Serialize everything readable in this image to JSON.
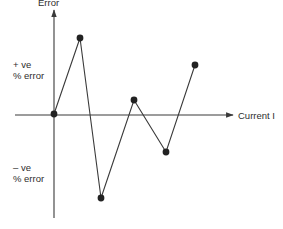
{
  "chart_data": {
    "type": "line",
    "title": "",
    "xlabel": "Current I",
    "ylabel": "Error",
    "annotations": [
      {
        "text": [
          "+ ve",
          "% error"
        ],
        "position": "upper-left, beside y-axis"
      },
      {
        "text": [
          "– ve",
          "% error"
        ],
        "position": "lower-left, beside y-axis"
      }
    ],
    "grid": false,
    "legend": null,
    "axis_ticks": "none (schematic)",
    "points_px": [
      [
        54,
        114
      ],
      [
        80,
        38
      ],
      [
        101,
        198
      ],
      [
        134,
        100
      ],
      [
        166,
        152
      ],
      [
        195,
        65
      ]
    ],
    "series": [
      {
        "name": "error vs current",
        "x": [
          0,
          1,
          2,
          3,
          4,
          5
        ],
        "y": [
          0,
          0.77,
          -0.85,
          0.14,
          -0.38,
          0.5
        ],
        "markers": true
      }
    ],
    "ylim": [
      -1,
      1
    ]
  },
  "labels": {
    "y_title": "Error",
    "x_title": "Current I",
    "positive_line1": "+ ve",
    "positive_line2": "% error",
    "negative_line1": "– ve",
    "negative_line2": "% error"
  },
  "colors": {
    "line": "#3a3a3a",
    "axis": "#3a3a3a",
    "marker": "#222222",
    "background": "#ffffff"
  }
}
